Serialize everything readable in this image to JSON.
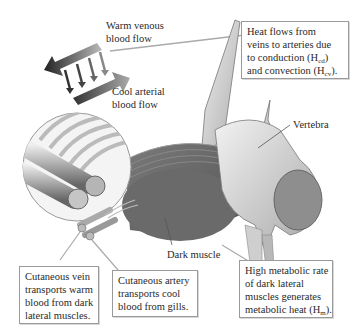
{
  "diagram": {
    "labels": {
      "warm_venous": [
        "Warm venous",
        "blood flow"
      ],
      "cool_arterial": [
        "Cool arterial",
        "blood flow"
      ],
      "vertebra": "Vertebra",
      "dark_muscle": "Dark muscle"
    },
    "callouts": {
      "heat_flow": {
        "lines": [
          "Heat flows from",
          "veins to arteries due",
          "to conduction (H",
          "and convection (H"
        ],
        "sub_cd": "cd",
        "sub_cv": "cv",
        "tail_cd": ")",
        "tail_cv": ")."
      },
      "cutaneous_vein": {
        "lines": [
          "Cutaneous vein",
          "transports warm",
          "blood from dark",
          "lateral muscles."
        ]
      },
      "cutaneous_artery": {
        "lines": [
          "Cutaneous artery",
          "transports cool",
          "blood from gills."
        ]
      },
      "metabolic": {
        "lines": [
          "High metabolic rate",
          "of dark lateral",
          "muscles generates",
          "metabolic heat (H"
        ],
        "sub_m": "m",
        "tail_m": ")."
      }
    },
    "colors": {
      "muscle": "#6e6e6e",
      "bone": "#d9d9d9",
      "arrow_dark": "#333333",
      "box_border": "#9a9a9a"
    }
  }
}
